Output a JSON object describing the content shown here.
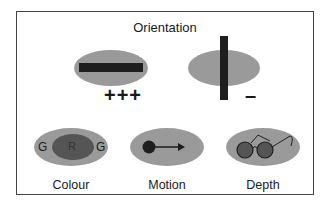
{
  "diagram": {
    "title": "Orientation",
    "orientation": {
      "preferred": {
        "bar": "horizontal",
        "response": "+++"
      },
      "orthogonal": {
        "bar": "vertical",
        "response": "–"
      }
    },
    "features": [
      {
        "label": "Colour",
        "center_letter": "R",
        "surround_letter_left": "G",
        "surround_letter_right": "G"
      },
      {
        "label": "Motion",
        "icon": "dot-arrow-icon"
      },
      {
        "label": "Depth",
        "icon": "glasses-icon"
      }
    ],
    "colors": {
      "ellipse": "#9a9a9a",
      "dark": "#1e1e1e",
      "center_fill": "#555555"
    }
  }
}
